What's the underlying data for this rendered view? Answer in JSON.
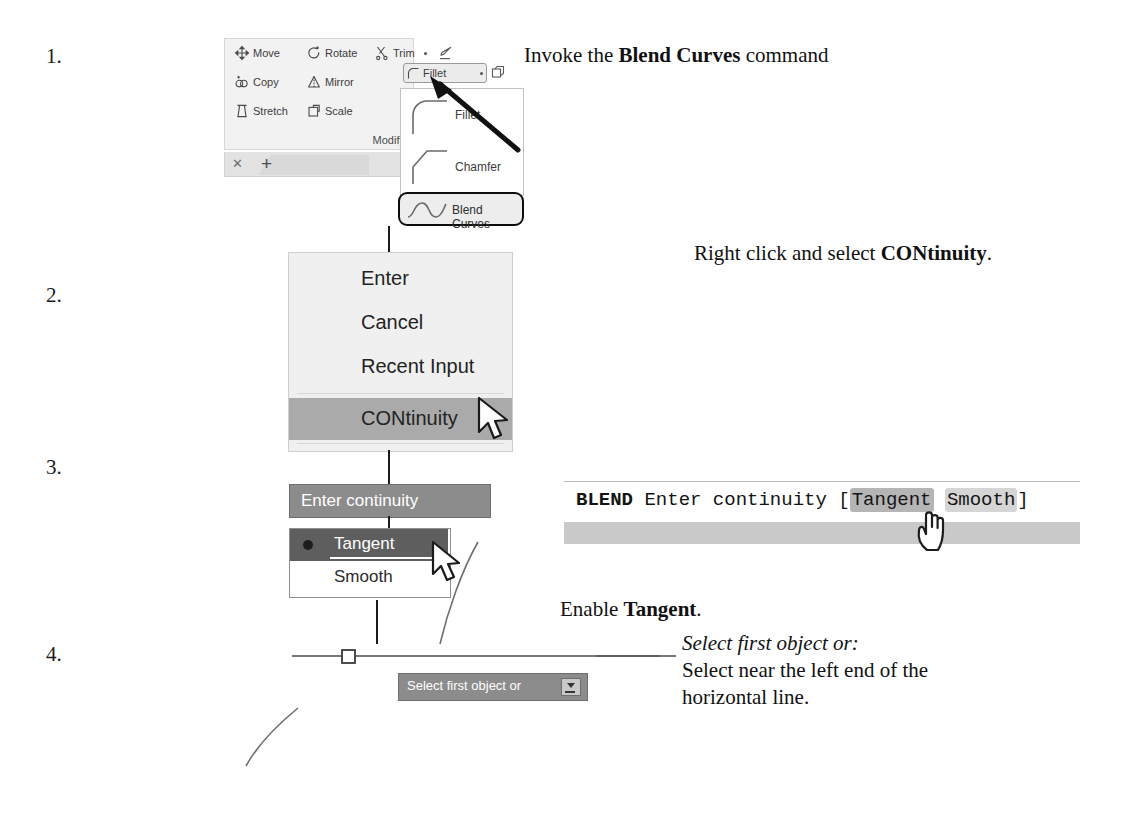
{
  "steps": [
    {
      "number": "1.",
      "instruction_plain_pre": "Invoke the ",
      "instruction_bold": "Blend Curves",
      "instruction_plain_post": " command"
    },
    {
      "number": "2.",
      "instruction_plain_pre": "Right click and select ",
      "instruction_bold": "CONtinuity",
      "instruction_plain_post": "."
    },
    {
      "number": "3.",
      "instruction_plain_pre": "Enable ",
      "instruction_bold": "Tangent",
      "instruction_plain_post": "."
    },
    {
      "number": "4.",
      "prompt_italic": "Select first object or:",
      "instruction_line1": "Select near the left end of the",
      "instruction_line2": "horizontal line."
    }
  ],
  "ribbon": {
    "buttons": [
      {
        "label": "Move",
        "icon": "move-icon"
      },
      {
        "label": "Rotate",
        "icon": "rotate-icon"
      },
      {
        "label": "Trim",
        "icon": "trim-icon"
      },
      {
        "label": "Copy",
        "icon": "copy-icon"
      },
      {
        "label": "Mirror",
        "icon": "mirror-icon"
      },
      {
        "label": "Stretch",
        "icon": "stretch-icon"
      },
      {
        "label": "Scale",
        "icon": "scale-icon"
      }
    ],
    "panel_title": "Modify",
    "fillet_button_label": "Fillet",
    "erase_icon": "erase-icon",
    "array_icon": "array-icon",
    "dropdown_arrow_icon": "chevron-down-icon"
  },
  "tabbar": {
    "close_icon": "close-icon",
    "new_tab_icon": "plus-icon"
  },
  "flyout": {
    "items": [
      {
        "label": "Fillet",
        "icon": "fillet-preview-icon"
      },
      {
        "label": "Chamfer",
        "icon": "chamfer-preview-icon"
      },
      {
        "label": "Blend Curves",
        "icon": "blend-curves-preview-icon",
        "highlighted": true
      }
    ]
  },
  "context_menu": {
    "items": [
      {
        "label": "Enter",
        "highlighted": false
      },
      {
        "label": "Cancel",
        "highlighted": false
      },
      {
        "label": "Recent Input",
        "highlighted": false
      },
      {
        "label": "CONtinuity",
        "highlighted": true
      }
    ],
    "cursor_icon": "arrow-cursor-icon"
  },
  "dynamic_input": {
    "prompt_label": "Enter continuity",
    "options": [
      {
        "label": "Tangent",
        "selected": true
      },
      {
        "label": "Smooth",
        "selected": false
      }
    ],
    "cursor_icon": "arrow-cursor-icon",
    "select_prompt_label": "Select first object or",
    "select_prompt_dropdown_icon": "dropdown-arrow-icon"
  },
  "command_line": {
    "command": "BLEND",
    "prompt": "Enter continuity",
    "bracket_open": "[",
    "option_highlighted": "Tangent",
    "option_normal": "Smooth",
    "bracket_close": "]",
    "cursor_icon": "hand-pointer-icon"
  },
  "drawing": {
    "horizontal_line_label": "horizontal-line",
    "grip_label": "square-grip",
    "arc_label": "arc-object"
  },
  "colors": {
    "ribbon_bg": "#f2f2f2",
    "menu_bg": "#f0f0f0",
    "menu_highlight": "#aaaaaa",
    "dyn_prompt_bg": "#8c8c8c",
    "dyn_selected_bg": "#5e5e5e",
    "cmd_strip": "#c9c9c9",
    "keyword_highlight": "#b5b5b5",
    "keyword_normal": "#d5d5d5",
    "text": "#111111"
  }
}
